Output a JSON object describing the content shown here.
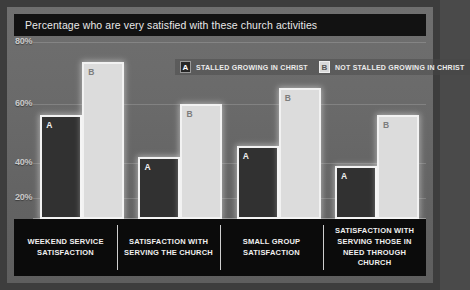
{
  "chart_data": {
    "type": "bar",
    "title": "Percentage who are very satisfied with these church activities",
    "xlabel": "",
    "ylabel": "",
    "ylim": [
      0,
      80
    ],
    "grid": true,
    "legend_position": "top-center",
    "ticks": [
      "80%",
      "60%",
      "40%",
      "20%"
    ],
    "tick_values": [
      80,
      60,
      40,
      20
    ],
    "categories": [
      "WEEKEND SERVICE SATISFACTION",
      "SATISFACTION WITH SERVING THE CHURCH",
      "SMALL GROUP SATISFACTION",
      "SATISFACTION WITH SERVING THOSE IN NEED THROUGH CHURCH"
    ],
    "series": [
      {
        "name": "STALLED GROWING IN CHRIST",
        "key": "A",
        "values": [
          47,
          28,
          33,
          24
        ]
      },
      {
        "name": "NOT STALLED GROWING IN CHRIST",
        "key": "B",
        "values": [
          71,
          52,
          59,
          47
        ]
      }
    ]
  },
  "legend": {
    "entries": [
      {
        "key": "A",
        "label": "STALLED GROWING IN CHRIST"
      },
      {
        "key": "B",
        "label": "NOT STALLED GROWING IN CHRIST"
      }
    ]
  },
  "colors": {
    "series_a": "#313131",
    "series_b": "#dcdcdc",
    "bar_outline": "#f2f2f2",
    "title_bar": "#121212",
    "category_band": "#0b0b0b",
    "plot_background": "#6a6a6a",
    "frame": "#3d3d3d"
  }
}
